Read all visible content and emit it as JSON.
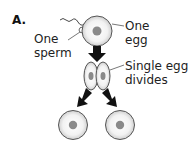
{
  "panel_label": "A.",
  "labels": {
    "sperm_line1": "One",
    "sperm_line2": "sperm",
    "egg_line1": "One",
    "egg_line2": "egg",
    "divide_line1": "Single egg",
    "divide_line2": "divides"
  },
  "colors": {
    "cell_fill": "#e8e8e8",
    "cell_stroke": "#555555",
    "nucleus": "#8a8a8a",
    "arrow": "#111111"
  }
}
